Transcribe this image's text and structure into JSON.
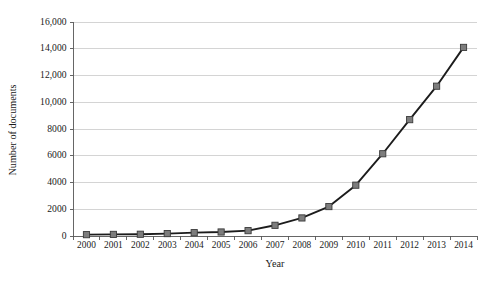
{
  "chart_data": {
    "type": "line",
    "title": "",
    "xlabel": "Year",
    "ylabel": "Number of documents",
    "categories": [
      "2000",
      "2001",
      "2002",
      "2003",
      "2004",
      "2005",
      "2006",
      "2007",
      "2008",
      "2009",
      "2010",
      "2011",
      "2012",
      "2013",
      "2014"
    ],
    "values": [
      100,
      120,
      130,
      180,
      250,
      300,
      400,
      800,
      1350,
      2200,
      3800,
      6150,
      8700,
      11200,
      14100
    ],
    "series": [
      {
        "name": "Number of documents",
        "values": [
          100,
          120,
          130,
          180,
          250,
          300,
          400,
          800,
          1350,
          2200,
          3800,
          6150,
          8700,
          11200,
          14100
        ]
      }
    ],
    "ylim": [
      0,
      16000
    ],
    "ytick_values": [
      0,
      2000,
      4000,
      6000,
      8000,
      10000,
      12000,
      14000,
      16000
    ],
    "ytick_labels": [
      "0",
      "2000",
      "4000",
      "6000",
      "8000",
      "10,000",
      "12,000",
      "14,000",
      "16,000"
    ],
    "grid": "horizontal",
    "legend": "none",
    "marker": "square",
    "marker_color": "#7d7d7d",
    "line_color": "#1c1c1c",
    "gridline_color": "#c9c9c9",
    "axis_color": "#555555"
  }
}
